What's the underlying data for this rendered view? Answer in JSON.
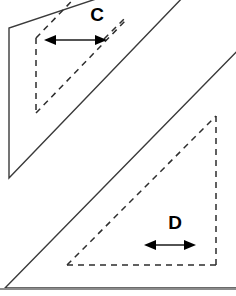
{
  "figure": {
    "background_color": "#ffffff",
    "canvas": {
      "width": 236,
      "height": 296
    },
    "colors": {
      "solid_edge": "#3a3a3a",
      "baseline_edge": "#8c8c8c",
      "dashed_edge": "#2d2d2d",
      "dimension_line": "#1a1a1a",
      "label_text": "#000000"
    },
    "shapes": [
      {
        "name": "upper-prism",
        "style": "solid",
        "description": "parallelogram slab, upper-left, clipped at top",
        "points": "111,-6 186,-6 9,178 9,28"
      },
      {
        "name": "lower-prism",
        "style": "solid",
        "description": "right triangle slab, lower-right, clipped at right",
        "points": "5,288 248,40 248,288"
      }
    ],
    "hidden_edges": [
      {
        "name": "upper-hidden-parallelogram",
        "style": "dashed",
        "description": "hidden face outline inside the upper prism",
        "segments": [
          {
            "name": "upper-hidden-left-vertical",
            "x1": 36,
            "y1": 38,
            "x2": 36,
            "y2": 113
          },
          {
            "name": "upper-hidden-top-diagonal",
            "x1": 36,
            "y1": 38,
            "x2": 125,
            "y2": -54
          },
          {
            "name": "upper-hidden-bottom-diagonal",
            "x1": 36,
            "y1": 113,
            "x2": 125,
            "y2": 21
          },
          {
            "name": "upper-hidden-right-diagonal",
            "x1": 107,
            "y1": 36,
            "x2": 125,
            "y2": 18
          }
        ]
      },
      {
        "name": "lower-hidden-triangle",
        "style": "dashed",
        "description": "hidden face outline inside the lower prism",
        "segments": [
          {
            "name": "lower-hidden-right-vertical",
            "x1": 216,
            "y1": 116,
            "x2": 216,
            "y2": 265
          },
          {
            "name": "lower-hidden-bottom-horizontal",
            "x1": 67,
            "y1": 265,
            "x2": 216,
            "y2": 265
          },
          {
            "name": "lower-hidden-hypotenuse",
            "x1": 67,
            "y1": 265,
            "x2": 216,
            "y2": 116
          }
        ]
      }
    ],
    "dimensions": [
      {
        "name": "dimension-c",
        "label": "C",
        "label_x": 97,
        "label_y": 21,
        "arrow_y": 40,
        "arrow_x_start": 44,
        "arrow_x_end": 107
      },
      {
        "name": "dimension-d",
        "label": "D",
        "label_x": 175,
        "label_y": 229,
        "arrow_y": 245,
        "arrow_x_start": 144,
        "arrow_x_end": 196
      }
    ]
  }
}
